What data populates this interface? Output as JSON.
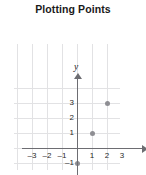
{
  "title": "Plotting Points",
  "axis": {
    "x_label": "x",
    "y_label": "y",
    "x_arrow": "right-arrow-icon",
    "y_arrow": "up-arrow-icon"
  },
  "chart_data": {
    "type": "scatter",
    "title": "Plotting Points",
    "xlabel": "x",
    "ylabel": "y",
    "xlim": [
      -4,
      4
    ],
    "ylim": [
      -4,
      4
    ],
    "grid": true,
    "legend": "none",
    "x_ticks": [
      "–3",
      "–2",
      "–1",
      "1",
      "2",
      "3"
    ],
    "x_tick_values": [
      -3,
      -2,
      -1,
      1,
      2,
      3
    ],
    "y_ticks": [
      "3",
      "2",
      "1",
      "–1",
      "–2"
    ],
    "y_tick_values": [
      3,
      2,
      1,
      -1,
      -2
    ],
    "points": [
      {
        "x": 2,
        "y": 3
      },
      {
        "x": 1,
        "y": 1
      },
      {
        "x": 0,
        "y": -1
      },
      {
        "x": -1,
        "y": -3
      }
    ],
    "point_color": "#8e8e93",
    "grid_color": "#e2e2e4",
    "axis_color": "#6d6d72"
  }
}
